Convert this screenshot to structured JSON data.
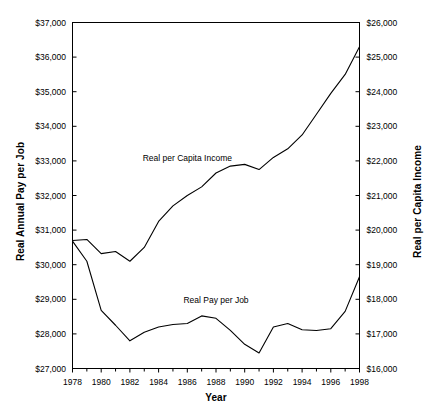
{
  "chart_data": {
    "type": "line",
    "title": "",
    "xlabel": "Year",
    "x": [
      1978,
      1979,
      1980,
      1981,
      1982,
      1983,
      1984,
      1985,
      1986,
      1987,
      1988,
      1989,
      1990,
      1991,
      1992,
      1993,
      1994,
      1995,
      1996,
      1997,
      1998
    ],
    "xlim": [
      1978,
      1998
    ],
    "xtick_labels": [
      "1978",
      "1980",
      "1982",
      "1984",
      "1986",
      "1988",
      "1990",
      "1992",
      "1994",
      "1996",
      "1998"
    ],
    "xtick_values": [
      1978,
      1980,
      1982,
      1984,
      1986,
      1988,
      1990,
      1992,
      1994,
      1996,
      1998
    ],
    "xticks_minor": "annual",
    "grid": false,
    "legend": "inline-labels",
    "series": [
      {
        "name": "Real per Capita Income",
        "axis": "right",
        "color": "#000000",
        "label_x": 1986,
        "label_y_left_units": 33050,
        "values_left_axis": [
          30700,
          30730,
          30320,
          30380,
          30100,
          30500,
          31250,
          31700,
          32000,
          32250,
          32650,
          32850,
          32900,
          32750,
          33100,
          33350,
          33750,
          34350,
          34950,
          35500,
          36300
        ],
        "values_right_axis": [
          19640,
          19670,
          19290,
          19350,
          19090,
          19480,
          20200,
          20640,
          20930,
          21170,
          21560,
          21750,
          21800,
          21660,
          22000,
          22240,
          22630,
          23210,
          23790,
          24320,
          25090
        ]
      },
      {
        "name": "Real Pay per Job",
        "axis": "left",
        "color": "#000000",
        "label_x": 1988,
        "label_y_left_units": 28950,
        "values_left_axis": [
          30680,
          30100,
          28680,
          28250,
          27800,
          28050,
          28200,
          28270,
          28300,
          28520,
          28450,
          28100,
          27700,
          27450,
          28200,
          28300,
          28120,
          28100,
          28150,
          28650,
          29650
        ]
      }
    ],
    "left_axis": {
      "label": "Real Annual Pay per Job",
      "ticks": [
        "$27,000",
        "$28,000",
        "$29,000",
        "$30,000",
        "$31,000",
        "$32,000",
        "$33,000",
        "$34,000",
        "$35,000",
        "$36,000",
        "$37,000"
      ],
      "tick_values": [
        27000,
        28000,
        29000,
        30000,
        31000,
        32000,
        33000,
        34000,
        35000,
        36000,
        37000
      ],
      "min": 27000,
      "max": 37000
    },
    "right_axis": {
      "label": "Real per Capita Income",
      "ticks": [
        "$16,000",
        "$17,000",
        "$18,000",
        "$19,000",
        "$20,000",
        "$21,000",
        "$22,000",
        "$23,000",
        "$24,000",
        "$25,000",
        "$26,000"
      ],
      "tick_values": [
        16000,
        17000,
        18000,
        19000,
        20000,
        21000,
        22000,
        23000,
        24000,
        25000,
        26000
      ],
      "min": 16000,
      "max": 26000
    }
  }
}
